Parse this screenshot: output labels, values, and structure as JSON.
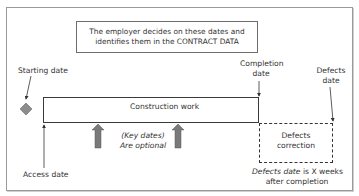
{
  "diagram": {
    "note": {
      "line1": "The employer decides on these dates and",
      "line2": "identifies them in the CONTRACT DATA"
    },
    "labels": {
      "starting_date": "Starting date",
      "completion_line1": "Completion",
      "completion_line2": "date",
      "defects_date_line1": "Defects",
      "defects_date_line2": "date",
      "access_date": "Access date",
      "construction_work": "Construction work",
      "key_dates_line1": "(Key dates)",
      "key_dates_line2": "Are optional",
      "defects_correction_line1": "Defects",
      "defects_correction_line2": "correction",
      "defects_note_line1_italic": "Defects date",
      "defects_note_line1_rest": " is X weeks",
      "defects_note_line2": "after completion"
    },
    "colors": {
      "frame_border": "#9a9a9a",
      "line": "#333333",
      "diamond_fill": "#8c8c8c",
      "key_arrow_fill": "#7a7a7a"
    }
  }
}
